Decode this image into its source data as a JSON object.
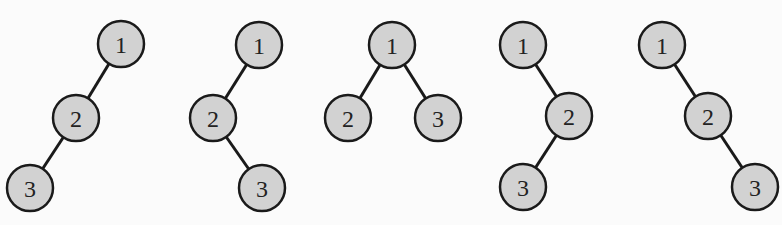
{
  "diagram": {
    "style": {
      "node_fill": "#d2d2d2",
      "node_stroke": "#1a1a1a",
      "edge_color": "#1a1a1a",
      "node_radius": 23
    },
    "trees": [
      {
        "id": "tree-1",
        "nodes": [
          {
            "label": "1",
            "x": 121,
            "y": 44
          },
          {
            "label": "2",
            "x": 76,
            "y": 118
          },
          {
            "label": "3",
            "x": 30,
            "y": 188
          }
        ],
        "edges": [
          [
            0,
            1
          ],
          [
            1,
            2
          ]
        ]
      },
      {
        "id": "tree-2",
        "nodes": [
          {
            "label": "1",
            "x": 259,
            "y": 45
          },
          {
            "label": "2",
            "x": 213,
            "y": 118
          },
          {
            "label": "3",
            "x": 262,
            "y": 188
          }
        ],
        "edges": [
          [
            0,
            1
          ],
          [
            1,
            2
          ]
        ]
      },
      {
        "id": "tree-3",
        "nodes": [
          {
            "label": "1",
            "x": 392,
            "y": 45
          },
          {
            "label": "2",
            "x": 348,
            "y": 118
          },
          {
            "label": "3",
            "x": 438,
            "y": 118
          }
        ],
        "edges": [
          [
            0,
            1
          ],
          [
            0,
            2
          ]
        ]
      },
      {
        "id": "tree-4",
        "nodes": [
          {
            "label": "1",
            "x": 523,
            "y": 45
          },
          {
            "label": "2",
            "x": 569,
            "y": 116
          },
          {
            "label": "3",
            "x": 523,
            "y": 187
          }
        ],
        "edges": [
          [
            0,
            1
          ],
          [
            1,
            2
          ]
        ]
      },
      {
        "id": "tree-5",
        "nodes": [
          {
            "label": "1",
            "x": 662,
            "y": 45
          },
          {
            "label": "2",
            "x": 708,
            "y": 116
          },
          {
            "label": "3",
            "x": 755,
            "y": 187
          }
        ],
        "edges": [
          [
            0,
            1
          ],
          [
            1,
            2
          ]
        ]
      }
    ]
  }
}
